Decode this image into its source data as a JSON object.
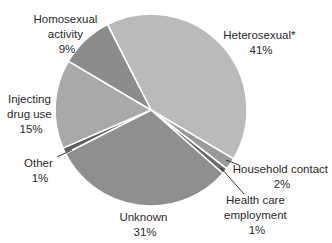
{
  "chart_data": {
    "type": "pie",
    "title": "",
    "start_direction": "upper-left",
    "direction": "clockwise",
    "slices": [
      {
        "label": "Heterosexual*",
        "value": 41,
        "display": "41%",
        "color": "#bababa"
      },
      {
        "label": "Household contact",
        "value": 2,
        "display": "2%",
        "color": "#9a9a9a"
      },
      {
        "label": "Health care employment",
        "value": 1,
        "display": "1%",
        "color": "#6a6a6a"
      },
      {
        "label": "Unknown",
        "value": 31,
        "display": "31%",
        "color": "#8f8f8f"
      },
      {
        "label": "Other",
        "value": 1,
        "display": "1%",
        "color": "#5f5f5f"
      },
      {
        "label": "Injecting drug use",
        "value": 15,
        "display": "15%",
        "color": "#a9a9a9"
      },
      {
        "label": "Homosexual activity",
        "value": 9,
        "display": "9%",
        "color": "#8c8c8c"
      }
    ]
  },
  "labels": {
    "heterosexual": {
      "lines": [
        "Heterosexual*",
        "41%"
      ]
    },
    "household": {
      "lines": [
        "Household contact",
        "2%"
      ]
    },
    "healthcare": {
      "lines": [
        "Health care",
        "employment",
        "1%"
      ]
    },
    "unknown": {
      "lines": [
        "Unknown",
        "31%"
      ]
    },
    "other": {
      "lines": [
        "Other",
        "1%"
      ]
    },
    "injecting": {
      "lines": [
        "Injecting",
        "drug use",
        "15%"
      ]
    },
    "homosexual": {
      "lines": [
        "Homosexual",
        "activity",
        "9%"
      ]
    }
  }
}
